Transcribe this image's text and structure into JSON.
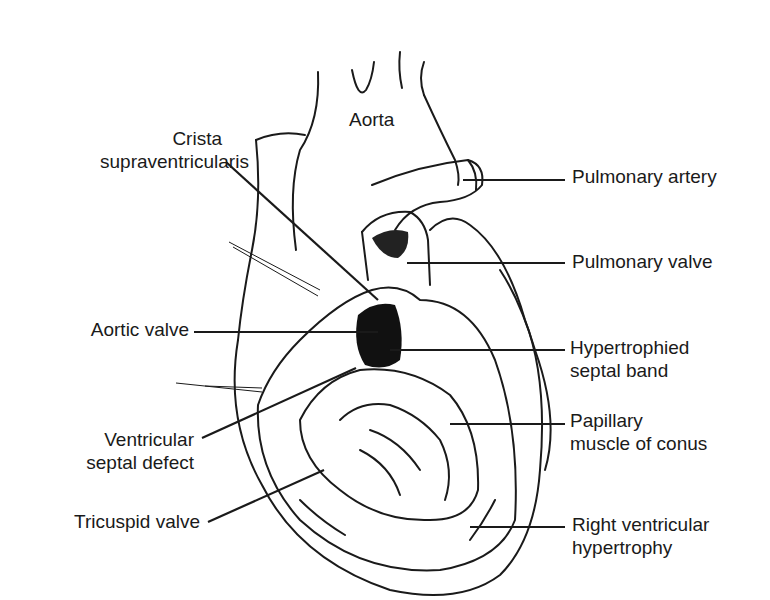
{
  "figure": {
    "colors": {
      "ink": "#1a1a1a",
      "background": "#ffffff"
    },
    "labels": {
      "aorta": {
        "lines": [
          "Aorta"
        ]
      },
      "crista": {
        "lines": [
          "Crista",
          "supraventricularis"
        ]
      },
      "pulmonary_artery": {
        "lines": [
          "Pulmonary artery"
        ]
      },
      "pulmonary_valve": {
        "lines": [
          "Pulmonary valve"
        ]
      },
      "aortic_valve": {
        "lines": [
          "Aortic valve"
        ]
      },
      "hypertrophied_septal_band": {
        "lines": [
          "Hypertrophied",
          "septal band"
        ]
      },
      "vsd": {
        "lines": [
          "Ventricular",
          "septal defect"
        ]
      },
      "papillary_muscle": {
        "lines": [
          "Papillary",
          "muscle of conus"
        ]
      },
      "tricuspid_valve": {
        "lines": [
          "Tricuspid valve"
        ]
      },
      "rv_hypertrophy": {
        "lines": [
          "Right ventricular",
          "hypertrophy"
        ]
      }
    }
  }
}
